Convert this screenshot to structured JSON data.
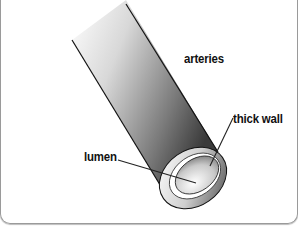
{
  "diagram": {
    "labels": {
      "title": "arteries",
      "wall": "thick wall",
      "lumen": "lumen"
    },
    "colors": {
      "outline": "#111111",
      "tube_dark": "#3a3a3a",
      "tube_light": "#f2f2f2",
      "background": "#ffffff",
      "frame": "#9a9a9a"
    }
  }
}
